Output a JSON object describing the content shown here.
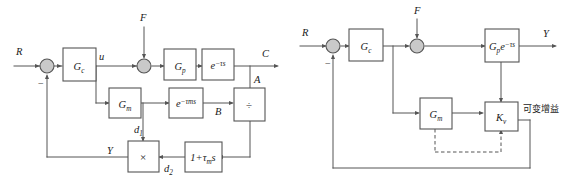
{
  "figure": {
    "kind": "control-block-diagram",
    "panels": [
      "left",
      "right"
    ],
    "colors": {
      "line": "#555555",
      "block_fill": "#ffffff",
      "junction_fill": "#c9c9c9",
      "text": "#1a1a1a",
      "background": "#ffffff"
    }
  },
  "left_diagram": {
    "name": "smith-predictor-detailed",
    "signals": {
      "reference": "R",
      "controller_output": "u",
      "disturbance": "F",
      "process_output": "C",
      "branch_a": "A",
      "branch_b": "B",
      "model_branch_d1": "d",
      "model_branch_d1_sub": "1",
      "compensator_branch_d2": "d",
      "compensator_branch_d2_sub": "2",
      "feedback": "Y",
      "minus": "−"
    },
    "blocks": [
      {
        "id": "gc",
        "label": "G",
        "sub": "c",
        "sup": ""
      },
      {
        "id": "gp",
        "label": "G",
        "sub": "p",
        "sup": ""
      },
      {
        "id": "delay",
        "label": "e",
        "sub": "",
        "sup": "−τs"
      },
      {
        "id": "gm",
        "label": "G",
        "sub": "m",
        "sup": ""
      },
      {
        "id": "delay_m",
        "label": "e",
        "sub": "",
        "sup": "−τms"
      },
      {
        "id": "divide",
        "label": "÷",
        "sub": "",
        "sup": ""
      },
      {
        "id": "multiply",
        "label": "×",
        "sub": "",
        "sup": ""
      },
      {
        "id": "lead",
        "label": "1+τ",
        "sub": "m",
        "sup": "",
        "tail": "s"
      }
    ]
  },
  "right_diagram": {
    "name": "smith-predictor-equivalent",
    "signals": {
      "reference": "R",
      "disturbance": "F",
      "output": "Y",
      "minus": "−"
    },
    "annotation": "可变增益",
    "blocks": [
      {
        "id": "gc",
        "label": "G",
        "sub": "c",
        "sup": ""
      },
      {
        "id": "gpe",
        "label": "G",
        "sub": "p",
        "sup": "−τs",
        "tail": "e"
      },
      {
        "id": "gm",
        "label": "G",
        "sub": "m",
        "sup": ""
      },
      {
        "id": "kv",
        "label": "K",
        "sub": "v",
        "sup": ""
      }
    ]
  }
}
